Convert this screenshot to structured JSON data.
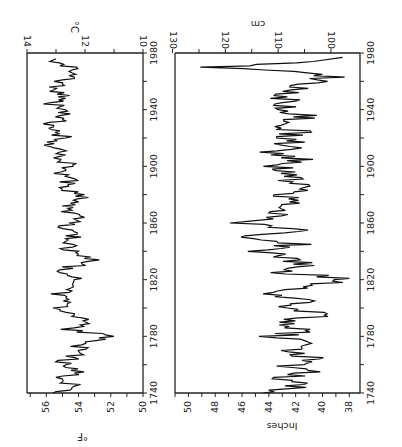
{
  "chart_data": [
    {
      "type": "line",
      "title": "",
      "orientation": "rotated 90 degrees (time axis runs vertically, 1740 at bottom, 1980 at top)",
      "xlabel": "",
      "ylabel_left": "°F",
      "ylabel_right": "°C",
      "x_ticks": [
        "1740",
        "1780",
        "1820",
        "1860",
        "1900",
        "1940",
        "1980"
      ],
      "y_ticks_f": [
        "50",
        "52",
        "54",
        "56"
      ],
      "y_ticks_c": [
        "10",
        "12",
        "14"
      ],
      "ylim_f": [
        50,
        57.2
      ],
      "ylim_c": [
        10,
        14
      ],
      "xlim": [
        1740,
        1980
      ],
      "grid": false,
      "series": [
        {
          "name": "Annual mean temperature",
          "x": [
            1740,
            1745,
            1750,
            1755,
            1760,
            1765,
            1770,
            1775,
            1780,
            1785,
            1790,
            1795,
            1800,
            1805,
            1810,
            1815,
            1820,
            1825,
            1830,
            1835,
            1840,
            1845,
            1850,
            1855,
            1860,
            1865,
            1870,
            1875,
            1880,
            1885,
            1890,
            1895,
            1900,
            1905,
            1910,
            1915,
            1920,
            1925,
            1930,
            1935,
            1940,
            1945,
            1950,
            1955,
            1960,
            1965,
            1970,
            1975
          ],
          "values": [
            55.6,
            54.2,
            55.3,
            54.0,
            55.2,
            54.3,
            53.8,
            53.9,
            52.0,
            54.6,
            53.2,
            54.8,
            55.0,
            54.5,
            55.4,
            53.7,
            54.2,
            55.3,
            54.2,
            53.0,
            54.5,
            54.8,
            54.2,
            55.0,
            54.6,
            54.1,
            55.1,
            54.5,
            53.7,
            55.0,
            54.6,
            55.4,
            54.3,
            55.1,
            54.7,
            55.6,
            54.9,
            55.3,
            55.7,
            54.8,
            55.2,
            55.7,
            54.9,
            55.5,
            55.0,
            54.5,
            54.7,
            55.4
          ]
        }
      ],
      "annotations": [
        "°F",
        "°C"
      ]
    },
    {
      "type": "line",
      "title": "",
      "orientation": "rotated 90 degrees (time axis runs vertically, 1740 at bottom, 1980 at top)",
      "xlabel": "",
      "ylabel_left": "Inches",
      "ylabel_right": "cm",
      "x_ticks": [
        "1740",
        "1780",
        "1820",
        "1860",
        "1900",
        "1940",
        "1980"
      ],
      "y_ticks_in": [
        "38",
        "40",
        "42",
        "44",
        "46",
        "48",
        "50"
      ],
      "y_ticks_cm": [
        "100",
        "110",
        "120",
        "130"
      ],
      "ylim_in": [
        37.2,
        51
      ],
      "ylim_cm": [
        97,
        130
      ],
      "xlim": [
        1740,
        1980
      ],
      "grid": false,
      "series": [
        {
          "name": "Annual precipitation",
          "x": [
            1740,
            1745,
            1750,
            1755,
            1760,
            1765,
            1770,
            1775,
            1780,
            1785,
            1790,
            1795,
            1800,
            1805,
            1810,
            1815,
            1820,
            1825,
            1830,
            1835,
            1840,
            1845,
            1850,
            1855,
            1860,
            1865,
            1870,
            1875,
            1880,
            1885,
            1890,
            1895,
            1900,
            1905,
            1910,
            1915,
            1920,
            1925,
            1930,
            1935,
            1940,
            1945,
            1950,
            1955,
            1960,
            1965,
            1970,
            1975
          ],
          "values": [
            43.8,
            41.8,
            43.0,
            41.3,
            42.4,
            41.0,
            42.0,
            40.8,
            43.5,
            41.2,
            43.9,
            39.8,
            42.5,
            41.0,
            43.6,
            41.5,
            38.0,
            42.7,
            41.2,
            43.0,
            44.3,
            42.1,
            45.2,
            42.3,
            46.2,
            43.5,
            44.0,
            42.1,
            43.3,
            41.6,
            42.8,
            42.3,
            43.2,
            41.9,
            43.5,
            42.2,
            42.8,
            41.8,
            43.8,
            41.2,
            43.3,
            42.0,
            43.5,
            42.2,
            40.3,
            39.2,
            48.0,
            38.5
          ]
        }
      ],
      "annotations": [
        "Inches",
        "cm"
      ]
    }
  ],
  "top_chart": {
    "unit_left": "°F",
    "unit_right": "°C",
    "year_labels": [
      "1740",
      "1780",
      "1820",
      "1860",
      "1900",
      "1940",
      "1980"
    ],
    "f_labels": [
      "50",
      "52",
      "54",
      "56"
    ],
    "c_labels": [
      "10",
      "12",
      "14"
    ]
  },
  "bottom_chart": {
    "unit_left": "Inches",
    "unit_right": "cm",
    "year_labels": [
      "1740",
      "1780",
      "1820",
      "1860",
      "1900",
      "1940",
      "1980"
    ],
    "in_labels": [
      "38",
      "40",
      "42",
      "44",
      "46",
      "48",
      "50"
    ],
    "cm_labels": [
      "100",
      "110",
      "120",
      "130"
    ]
  }
}
